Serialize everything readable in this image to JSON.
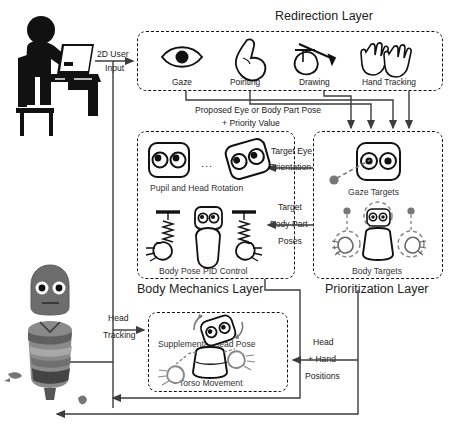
{
  "diagram": {
    "layers": [
      {
        "id": "redirection",
        "label": "Redirection Layer",
        "modules": [
          {
            "id": "gaze",
            "label": "Gaze",
            "icon": "eye-icon"
          },
          {
            "id": "pointing",
            "label": "Pointing",
            "icon": "pointing-hand-icon"
          },
          {
            "id": "drawing",
            "label": "Drawing",
            "icon": "drawing-hand-icon"
          },
          {
            "id": "hand-tracking",
            "label": "Hand Tracking",
            "icon": "two-hands-icon"
          }
        ]
      },
      {
        "id": "body-mechanics",
        "label": "Body Mechanics Layer",
        "modules": [
          {
            "id": "pupil-head-rotation",
            "label": "Pupil and Head Rotation",
            "icon": "robot-face-rotation-icon",
            "ellipsis": "..."
          },
          {
            "id": "body-pose-pid",
            "label": "Body Pose PID Control",
            "icon": "spring-damper-body-icon"
          },
          {
            "id": "supplemental-head-pose",
            "label": "Supplemental Head Pose",
            "icon": "rotating-robot-head-icon"
          },
          {
            "id": "torso-movement",
            "label": "Torso Movement",
            "icon": "torso-hands-icon"
          }
        ]
      },
      {
        "id": "prioritization",
        "label": "Prioritization Layer",
        "modules": [
          {
            "id": "gaze-targets",
            "label": "Gaze Targets",
            "icon": "robot-face-target-icon"
          },
          {
            "id": "body-targets",
            "label": "Body Targets",
            "icon": "robot-body-targets-icon"
          }
        ]
      }
    ],
    "actors": [
      {
        "id": "user",
        "label": "seated user at laptop",
        "icon": "person-at-laptop-icon"
      },
      {
        "id": "robot",
        "label": "physical robot",
        "icon": "robot-photo-icon"
      }
    ],
    "edges": [
      {
        "id": "user-input",
        "label": "2D User\nInput",
        "line1": "2D User",
        "line2": "Input"
      },
      {
        "id": "proposed-pose",
        "line1": "Proposed Eye or Body Part Pose",
        "line2": "+ Priority Value"
      },
      {
        "id": "target-eye-orientation",
        "line1": "Target Eye",
        "line2": "Orientation"
      },
      {
        "id": "target-body-part-poses",
        "line1": "Target",
        "line2": "Body Part",
        "line3": "Poses"
      },
      {
        "id": "head-tracking",
        "line1": "Head",
        "line2": "Tracking"
      },
      {
        "id": "head-hand-positions",
        "line1": "Head",
        "line2": "+ Hand",
        "line3": "Positions"
      }
    ]
  },
  "colors": {
    "ink": "#111111",
    "line": "#3c3c3c",
    "dash": "#111111",
    "paper": "#ffffff",
    "gray_art": "#6f6f6f"
  }
}
